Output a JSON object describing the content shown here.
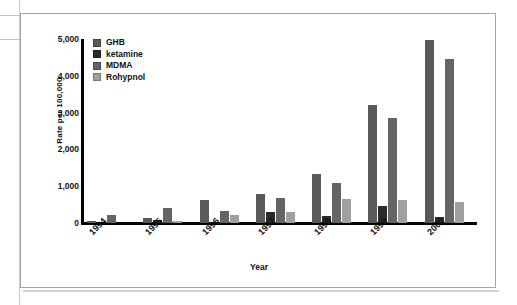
{
  "chart_data": {
    "type": "bar",
    "title": "",
    "xlabel": "Year",
    "ylabel": "Rate per 100,000",
    "categories": [
      "1994",
      "1995",
      "1996",
      "1997",
      "1998",
      "1999",
      "2000"
    ],
    "ylim": [
      0,
      5000
    ],
    "yticks": [
      0,
      1000,
      2000,
      3000,
      4000,
      5000
    ],
    "ytick_labels": [
      "0",
      "1,000",
      "2,000",
      "3,000",
      "4,000",
      "5,000"
    ],
    "grid": false,
    "legend_position": "top-left",
    "series": [
      {
        "name": "GHB",
        "color": "#595959",
        "values": [
          55,
          145,
          630,
          800,
          1320,
          3200,
          4980
        ]
      },
      {
        "name": "ketamine",
        "color": "#2a2a2a",
        "values": [
          0,
          80,
          0,
          300,
          200,
          450,
          170
        ]
      },
      {
        "name": "MDMA",
        "color": "#646464",
        "values": [
          220,
          420,
          320,
          690,
          1100,
          2850,
          4450
        ]
      },
      {
        "name": "Rohypnol",
        "color": "#a0a0a0",
        "values": [
          0,
          55,
          230,
          310,
          660,
          620,
          570
        ]
      }
    ]
  },
  "legend": {
    "items": [
      {
        "label": "GHB"
      },
      {
        "label": "ketamine"
      },
      {
        "label": "MDMA"
      },
      {
        "label": "Rohypnol"
      }
    ]
  }
}
